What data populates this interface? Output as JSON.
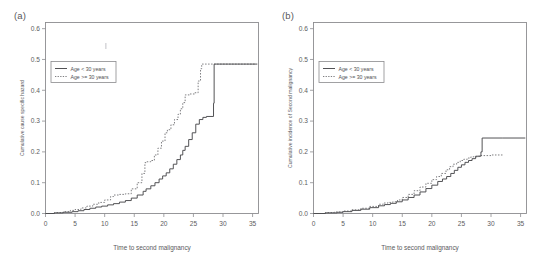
{
  "figure": {
    "panels": [
      {
        "tag": "(a)",
        "xlabel": "Time to second malignancy",
        "ylabel": "Cumulative cause specific hazard",
        "xticks": [
          "0",
          "5",
          "10",
          "15",
          "20",
          "25",
          "30",
          "35"
        ],
        "yticks": [
          "0.0",
          "0.1",
          "0.2",
          "0.3",
          "0.4",
          "0.5",
          "0.6"
        ],
        "legend": [
          "Age < 30 years",
          "Age >= 30 years"
        ]
      },
      {
        "tag": "(b)",
        "xlabel": "Time to second malignancy",
        "ylabel": "Cumulative incidence of Second malignancy",
        "xticks": [
          "0",
          "5",
          "10",
          "15",
          "20",
          "25",
          "30",
          "35"
        ],
        "yticks": [
          "0.0",
          "0.1",
          "0.2",
          "0.3",
          "0.4",
          "0.5",
          "0.6"
        ],
        "legend": [
          "Age < 30 years",
          "Age >= 30 years"
        ]
      }
    ]
  },
  "chart_data": [
    {
      "type": "line",
      "title": "(a)",
      "xlabel": "Time to second malignancy",
      "ylabel": "Cumulative cause specific hazard",
      "xlim": [
        0,
        36
      ],
      "ylim": [
        0.0,
        0.62
      ],
      "xticks": [
        0,
        5,
        10,
        15,
        20,
        25,
        30,
        35
      ],
      "yticks": [
        0.0,
        0.1,
        0.2,
        0.3,
        0.4,
        0.5,
        0.6
      ],
      "grid": false,
      "legend_position": "upper left",
      "step": "post",
      "series": [
        {
          "name": "Age < 30 years",
          "style": "solid",
          "x": [
            0,
            1.5,
            3.0,
            4.5,
            5.5,
            6.5,
            7.5,
            8.5,
            9.5,
            10.5,
            11.5,
            12.5,
            13.5,
            14.5,
            15.5,
            16.5,
            17.0,
            17.8,
            18.5,
            19.2,
            19.8,
            20.4,
            21.0,
            21.6,
            22.2,
            22.8,
            23.2,
            23.6,
            24.2,
            24.8,
            25.4,
            26.0,
            26.6,
            27.2,
            28.4,
            28.5,
            31.0,
            35.8
          ],
          "y": [
            0.0,
            0.002,
            0.004,
            0.006,
            0.009,
            0.013,
            0.017,
            0.021,
            0.024,
            0.028,
            0.032,
            0.037,
            0.042,
            0.05,
            0.06,
            0.072,
            0.08,
            0.09,
            0.1,
            0.112,
            0.122,
            0.132,
            0.145,
            0.16,
            0.175,
            0.19,
            0.205,
            0.218,
            0.24,
            0.262,
            0.29,
            0.305,
            0.312,
            0.315,
            0.358,
            0.485,
            0.485,
            0.485
          ]
        },
        {
          "name": "Age >= 30 years",
          "style": "dotted",
          "x": [
            0,
            1.5,
            3.0,
            4.2,
            5.0,
            6.0,
            7.0,
            8.0,
            9.0,
            10.0,
            11.0,
            11.5,
            12.5,
            13.5,
            14.5,
            15.5,
            16.3,
            16.8,
            17.0,
            17.8,
            18.4,
            19.0,
            19.6,
            20.2,
            20.6,
            21.2,
            21.8,
            22.4,
            22.8,
            23.2,
            23.6,
            24.4,
            25.2,
            25.8,
            26.2,
            26.4,
            28.0,
            31.5,
            35.6
          ],
          "y": [
            0.0,
            0.003,
            0.006,
            0.01,
            0.013,
            0.018,
            0.024,
            0.03,
            0.036,
            0.044,
            0.055,
            0.06,
            0.062,
            0.064,
            0.08,
            0.1,
            0.13,
            0.165,
            0.168,
            0.172,
            0.19,
            0.212,
            0.235,
            0.262,
            0.272,
            0.288,
            0.305,
            0.322,
            0.34,
            0.36,
            0.385,
            0.388,
            0.392,
            0.43,
            0.47,
            0.485,
            0.485,
            0.485,
            0.485
          ]
        }
      ]
    },
    {
      "type": "line",
      "title": "(b)",
      "xlabel": "Time to second malignancy",
      "ylabel": "Cumulative incidence of Second malignancy",
      "xlim": [
        0,
        36
      ],
      "ylim": [
        0.0,
        0.62
      ],
      "xticks": [
        0,
        5,
        10,
        15,
        20,
        25,
        30,
        35
      ],
      "yticks": [
        0.0,
        0.1,
        0.2,
        0.3,
        0.4,
        0.5,
        0.6
      ],
      "grid": false,
      "legend_position": "upper left",
      "step": "post",
      "series": [
        {
          "name": "Age < 30 years",
          "style": "solid",
          "x": [
            0,
            2.0,
            4.0,
            5.0,
            6.5,
            8.0,
            9.5,
            11.0,
            12.0,
            13.0,
            14.0,
            15.0,
            16.0,
            17.0,
            18.0,
            19.0,
            20.0,
            21.0,
            21.8,
            22.5,
            23.2,
            23.8,
            24.4,
            25.0,
            25.6,
            26.2,
            26.8,
            27.4,
            28.3,
            28.5,
            32.0,
            35.8
          ],
          "y": [
            0.0,
            0.002,
            0.004,
            0.006,
            0.01,
            0.014,
            0.019,
            0.025,
            0.029,
            0.033,
            0.038,
            0.044,
            0.052,
            0.06,
            0.07,
            0.081,
            0.092,
            0.104,
            0.112,
            0.12,
            0.13,
            0.14,
            0.15,
            0.158,
            0.166,
            0.172,
            0.178,
            0.186,
            0.2,
            0.245,
            0.245,
            0.245
          ]
        },
        {
          "name": "Age >= 30 years",
          "style": "dotted",
          "x": [
            0,
            2.0,
            3.5,
            5.0,
            6.5,
            8.0,
            9.5,
            11.0,
            11.8,
            12.6,
            13.4,
            14.2,
            15.0,
            16.0,
            17.0,
            18.0,
            19.0,
            20.0,
            20.8,
            21.6,
            22.4,
            23.0,
            23.6,
            24.2,
            24.8,
            25.4,
            26.0,
            26.6,
            28.0,
            30.0,
            32.0
          ],
          "y": [
            0.0,
            0.003,
            0.005,
            0.008,
            0.012,
            0.017,
            0.023,
            0.03,
            0.034,
            0.036,
            0.038,
            0.044,
            0.052,
            0.062,
            0.074,
            0.086,
            0.098,
            0.11,
            0.12,
            0.13,
            0.142,
            0.152,
            0.16,
            0.166,
            0.172,
            0.176,
            0.18,
            0.184,
            0.188,
            0.19,
            0.19
          ]
        }
      ]
    }
  ]
}
